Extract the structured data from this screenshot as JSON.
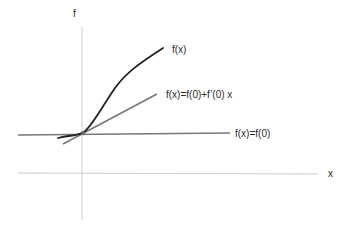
{
  "diagram": {
    "title": "",
    "axes": {
      "y_label": "f",
      "x_label": "x"
    },
    "curves": [
      {
        "name": "function",
        "label": "f(x)",
        "color": "#222222"
      },
      {
        "name": "tangent-line",
        "label": "f(x)=f(0)+f’(0) x",
        "color": "#777777"
      },
      {
        "name": "constant-line",
        "label": "f(x)=f(0)",
        "color": "#777777"
      }
    ],
    "colors": {
      "axis": "#cccccc",
      "curve": "#222222",
      "approx": "#777777"
    }
  }
}
